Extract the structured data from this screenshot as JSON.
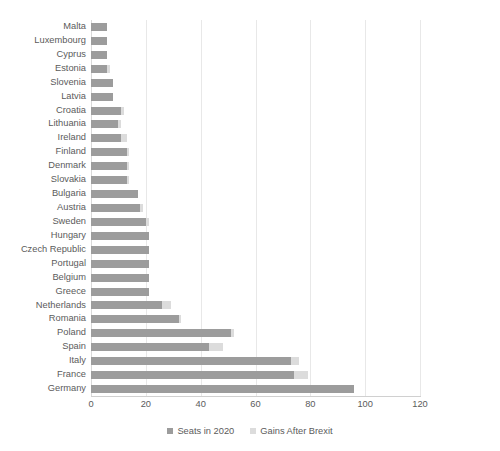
{
  "chart_data": {
    "type": "bar",
    "orientation": "horizontal",
    "stacked": true,
    "title": "",
    "xlabel": "",
    "ylabel": "",
    "xlim": [
      0,
      120
    ],
    "xticks": [
      0,
      20,
      40,
      60,
      80,
      100,
      120
    ],
    "grid": true,
    "legend_position": "bottom",
    "categories": [
      "Malta",
      "Luxembourg",
      "Cyprus",
      "Estonia",
      "Slovenia",
      "Latvia",
      "Croatia",
      "Lithuania",
      "Ireland",
      "Finland",
      "Denmark",
      "Slovakia",
      "Bulgaria",
      "Austria",
      "Sweden",
      "Hungary",
      "Czech Republic",
      "Portugal",
      "Belgium",
      "Greece",
      "Netherlands",
      "Romania",
      "Poland",
      "Spain",
      "Italy",
      "France",
      "Germany"
    ],
    "series": [
      {
        "name": "Seats in 2020",
        "color": "#9c9c9c",
        "values": [
          6,
          6,
          6,
          6,
          8,
          8,
          11,
          10,
          11,
          13,
          13,
          13,
          17,
          18,
          20,
          21,
          21,
          21,
          21,
          21,
          26,
          32,
          51,
          43,
          73,
          74,
          96
        ]
      },
      {
        "name": "Gains After Brexit",
        "color": "#dcdcdc",
        "values": [
          0,
          0,
          0,
          1,
          0,
          0,
          1,
          1,
          2,
          1,
          1,
          1,
          0,
          1,
          1,
          0,
          0,
          0,
          0,
          0,
          3,
          1,
          1,
          5,
          3,
          5,
          0
        ]
      }
    ]
  },
  "legend": {
    "items": [
      {
        "label": "Seats in 2020",
        "swatch": "base"
      },
      {
        "label": "Gains After Brexit",
        "swatch": "gain"
      }
    ]
  },
  "axis": {
    "tick_labels": [
      "0",
      "20",
      "40",
      "60",
      "80",
      "100",
      "120"
    ]
  }
}
